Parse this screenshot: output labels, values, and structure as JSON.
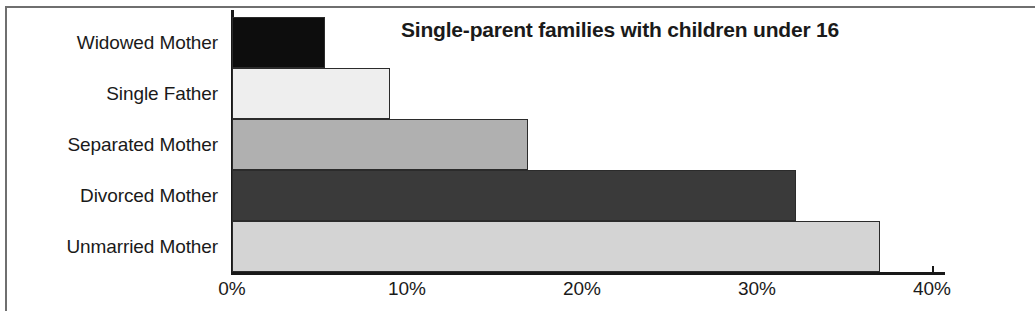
{
  "chart_data": {
    "type": "bar",
    "orientation": "horizontal",
    "title": "Single-parent families with children under 16",
    "subtitle": "",
    "xlabel": "",
    "ylabel": "",
    "categories": [
      "Widowed Mother",
      "Single Father",
      "Separated Mother",
      "Divorced Mother",
      "Unmarried Mother"
    ],
    "values": [
      5.3,
      9.0,
      16.9,
      32.2,
      37.0
    ],
    "value_suffix": "%",
    "xlim": [
      0,
      41
    ],
    "xticks": [
      0,
      10,
      20,
      30,
      40
    ],
    "xtick_labels": [
      "0%",
      "10%",
      "20%",
      "30%",
      "40%"
    ],
    "grid": false,
    "legend": false,
    "bar_colors": [
      "#0d0d0d",
      "#eeeeee",
      "#b0b0b0",
      "#3a3a3a",
      "#d4d4d4"
    ],
    "bar_edge_color": "#2b2b2b",
    "axis_color": "#181818",
    "text_color": "#1a1a1a",
    "background": "#ffffff"
  }
}
